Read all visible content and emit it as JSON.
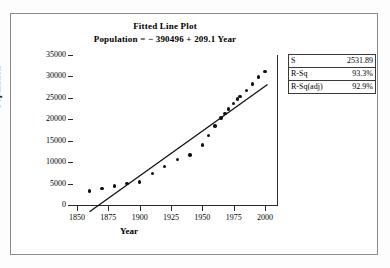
{
  "figure": {
    "title": "Fitted Line Plot",
    "subtitle": "Population = − 390496 + 209.1 Year"
  },
  "stats_box": {
    "rows": [
      {
        "key": "S",
        "value": "2531.89"
      },
      {
        "key": "R-Sq",
        "value": "93.3%"
      },
      {
        "key": "R-Sq(adj)",
        "value": "92.9%"
      }
    ]
  },
  "axes": {
    "x_title": "Year",
    "y_title": "Population",
    "x_ticks": [
      "1850",
      "1875",
      "1900",
      "1925",
      "1950",
      "1975",
      "2000"
    ],
    "y_ticks": [
      "0",
      "5000",
      "10000",
      "15000",
      "20000",
      "25000",
      "30000",
      "35000"
    ]
  },
  "colors": {
    "marker": "#111111",
    "line": "#111111",
    "axis": "#2b2b2b",
    "frame": "#8a8a8a",
    "background": "#ffffff"
  },
  "chart_data": {
    "type": "scatter",
    "title": "Fitted Line Plot",
    "subtitle": "Population = − 390496 + 209.1 Year",
    "xlabel": "Year",
    "ylabel": "Population",
    "xlim": [
      1850,
      2000
    ],
    "ylim": [
      0,
      35000
    ],
    "xticks": [
      1850,
      1875,
      1900,
      1925,
      1950,
      1975,
      2000
    ],
    "yticks": [
      0,
      5000,
      10000,
      15000,
      20000,
      25000,
      30000,
      35000
    ],
    "grid": false,
    "legend": false,
    "series": [
      {
        "name": "Population",
        "type": "scatter",
        "marker": "filled-circle",
        "x": [
          1860,
          1870,
          1880,
          1890,
          1900,
          1910,
          1920,
          1930,
          1940,
          1950,
          1955,
          1960,
          1965,
          1968,
          1971,
          1975,
          1978,
          1980,
          1985,
          1990,
          1995,
          2000
        ],
        "y": [
          3300,
          3800,
          4400,
          5000,
          5400,
          7300,
          9000,
          10600,
          11700,
          14000,
          16200,
          18400,
          20300,
          21400,
          22400,
          23700,
          24700,
          25300,
          26700,
          28200,
          29900,
          31100
        ]
      },
      {
        "name": "Fitted regression line",
        "type": "line",
        "equation": "Population = -390496 + 209.1 * Year",
        "slope": 209.1,
        "intercept": -390496,
        "x": [
          1860,
          2002
        ],
        "y": [
          -1574,
          28118
        ]
      }
    ],
    "annotations": [
      {
        "label": "S",
        "value": "2531.89"
      },
      {
        "label": "R-Sq",
        "value": "93.3%"
      },
      {
        "label": "R-Sq(adj)",
        "value": "92.9%"
      }
    ]
  }
}
